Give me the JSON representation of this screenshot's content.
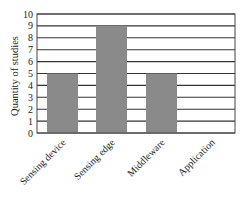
{
  "chart_data": {
    "type": "bar",
    "title": "",
    "xlabel": "",
    "ylabel": "Quantity of studies",
    "categories": [
      "Sensing device",
      "Sensing edge",
      "Middleware",
      "Application"
    ],
    "values": [
      5,
      9,
      5,
      0
    ],
    "ylim": [
      0,
      10
    ],
    "yticks": [
      0,
      1,
      2,
      3,
      4,
      5,
      6,
      7,
      8,
      9,
      10
    ],
    "grid": true,
    "legend": null,
    "bar_color": "#8a8a8a",
    "grid_color": "#333333",
    "frame_color": "#444444"
  }
}
